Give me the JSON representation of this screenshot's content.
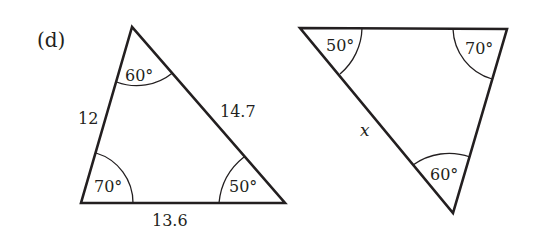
{
  "part_label": "(d)",
  "triangles": [
    {
      "name": "left-triangle",
      "vertices": {
        "top": [
          132,
          27
        ],
        "bottom_left": [
          81,
          203
        ],
        "bottom_right": [
          285,
          203
        ]
      },
      "angles": {
        "top": "60°",
        "bottom_left": "70°",
        "bottom_right": "50°"
      },
      "sides": {
        "left": "12",
        "right": "14.7",
        "bottom": "13.6"
      }
    },
    {
      "name": "right-triangle",
      "vertices": {
        "top_left": [
          300,
          28
        ],
        "top_right": [
          507,
          29
        ],
        "bottom": [
          453,
          213
        ]
      },
      "angles": {
        "top_left": "50°",
        "top_right": "70°",
        "bottom": "60°"
      },
      "sides": {
        "left": "x"
      }
    }
  ],
  "colors": {
    "stroke": "#231f20",
    "background": "#ffffff"
  }
}
